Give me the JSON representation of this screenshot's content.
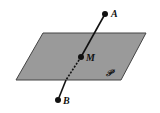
{
  "diagram": {
    "plane": {
      "label": "𝒫",
      "fill": "#9a9a9a",
      "stroke": "#444444",
      "vertices": [
        [
          43,
          33
        ],
        [
          146,
          33
        ],
        [
          121,
          80
        ],
        [
          16,
          80
        ]
      ]
    },
    "points": [
      {
        "id": "A",
        "label": "A",
        "x": 105,
        "y": 14
      },
      {
        "id": "M",
        "label": "M",
        "x": 81,
        "y": 57
      },
      {
        "id": "B",
        "label": "B",
        "x": 58,
        "y": 100
      }
    ],
    "line": {
      "from": "A",
      "to": "B",
      "hidden_segment": [
        [
          78,
          63
        ],
        [
          66,
          80
        ]
      ]
    }
  }
}
